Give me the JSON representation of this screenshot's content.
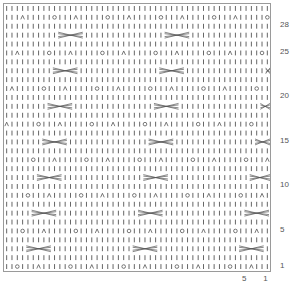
{
  "chart_title": "",
  "grid": {
    "columns": 50,
    "rows": 30,
    "stroke_color": "#555555",
    "border_color": "#9a9a9a",
    "symbols": {
      "knit": "vertical-bar",
      "yarn_over": "circle",
      "decrease": "caret",
      "cable": "crossed-lines"
    }
  },
  "row_labels": [
    {
      "label": "28",
      "row": 28
    },
    {
      "label": "25",
      "row": 25
    },
    {
      "label": "20",
      "row": 20
    },
    {
      "label": "15",
      "row": 15
    },
    {
      "label": "10",
      "row": 10
    },
    {
      "label": "5",
      "row": 5
    },
    {
      "label": "1",
      "row": 1
    }
  ],
  "col_labels": [
    {
      "label": "5",
      "col": 5
    },
    {
      "label": "1",
      "col": 1
    }
  ]
}
